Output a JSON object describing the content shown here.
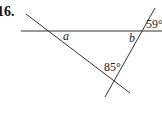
{
  "problem": {
    "number": "16."
  },
  "diagram": {
    "line_color": "#333333",
    "lines": [
      {
        "name": "horizontal-line",
        "x1": 21,
        "y1": 31,
        "x2": 162,
        "y2": 31
      },
      {
        "name": "diagonal-line",
        "x1": 26,
        "y1": 14,
        "x2": 130,
        "y2": 93
      },
      {
        "name": "transversal-line",
        "x1": 155,
        "y1": 8,
        "x2": 105,
        "y2": 97
      }
    ],
    "labels": {
      "angle_a": "a",
      "angle_b": "b",
      "angle_59": "59°",
      "angle_85": "85°"
    }
  }
}
